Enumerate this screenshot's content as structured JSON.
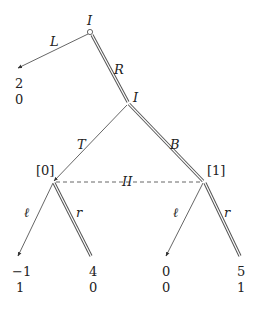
{
  "tree": {
    "root": {
      "player": "I",
      "x": 90,
      "y": 32
    },
    "nodes": [
      {
        "id": "n1",
        "player": "I",
        "x": 128,
        "y": 103
      },
      {
        "id": "n2",
        "label": "[0]",
        "x": 53,
        "y": 182
      },
      {
        "id": "n3",
        "label": "[1]",
        "x": 204,
        "y": 182
      }
    ],
    "info_set_label": "II",
    "edges": [
      {
        "label": "L",
        "from": "root",
        "to": "leaf0",
        "chosen": false
      },
      {
        "label": "R",
        "from": "root",
        "to": "n1",
        "chosen": true
      },
      {
        "label": "T",
        "from": "n1",
        "to": "n2",
        "chosen": false
      },
      {
        "label": "B",
        "from": "n1",
        "to": "n3",
        "chosen": true
      },
      {
        "label": "ℓ",
        "from": "n2",
        "to": "leaf1",
        "chosen": false
      },
      {
        "label": "r",
        "from": "n2",
        "to": "leaf2",
        "chosen": true
      },
      {
        "label": "ℓ",
        "from": "n3",
        "to": "leaf3",
        "chosen": false
      },
      {
        "label": "r",
        "from": "n3",
        "to": "leaf4",
        "chosen": true
      }
    ],
    "payoffs": [
      {
        "leaf": "leaf0",
        "p1": "2",
        "p2": "0"
      },
      {
        "leaf": "leaf1",
        "p1": "−1",
        "p2": "1"
      },
      {
        "leaf": "leaf2",
        "p1": "4",
        "p2": "0"
      },
      {
        "leaf": "leaf3",
        "p1": "0",
        "p2": "0"
      },
      {
        "leaf": "leaf4",
        "p1": "5",
        "p2": "1"
      }
    ]
  }
}
